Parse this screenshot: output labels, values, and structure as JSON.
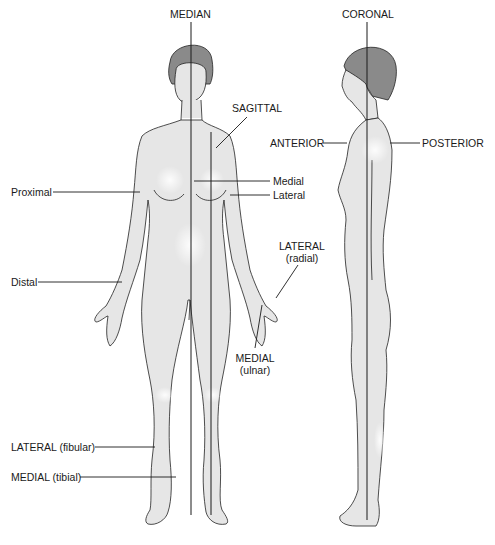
{
  "figure": {
    "type": "anatomical-planes-and-directions",
    "skin_color": "#e6e6e6",
    "hair_color": "#8a8a8a",
    "line_color": "#1a1a1a"
  },
  "labels": {
    "median": "MEDIAN",
    "coronal": "CORONAL",
    "sagittal": "SAGITTAL",
    "anterior": "ANTERIOR",
    "posterior": "POSTERIOR",
    "proximal": "Proximal",
    "medial": "Medial",
    "lateral": "Lateral",
    "distal": "Distal",
    "lateral_radial_1": "LATERAL",
    "lateral_radial_2": "(radial)",
    "medial_ulnar_1": "MEDIAL",
    "medial_ulnar_2": "(ulnar)",
    "lateral_fibular": "LATERAL (fibular)",
    "medial_tibial": "MEDIAL (tibial)"
  }
}
